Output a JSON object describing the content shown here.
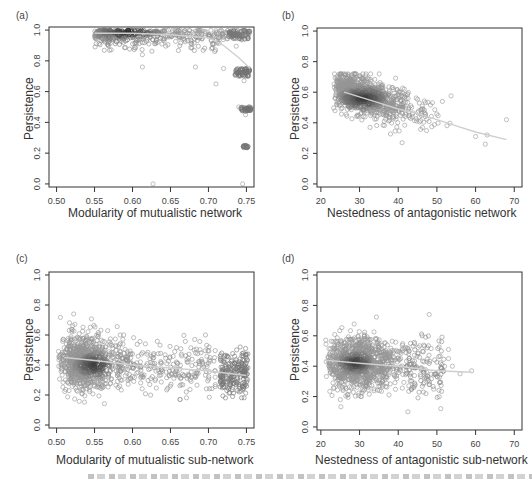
{
  "figure": {
    "panels": [
      {
        "id": "a",
        "label": "(a)",
        "xlabel": "Modularity of mutualistic network",
        "ylabel": "Persistence"
      },
      {
        "id": "b",
        "label": "(b)",
        "xlabel": "Nestedness of antagonistic network",
        "ylabel": "Persistence"
      },
      {
        "id": "c",
        "label": "(c)",
        "xlabel": "Modularity of mutualistic sub-network",
        "ylabel": "Persistence"
      },
      {
        "id": "d",
        "label": "(d)",
        "xlabel": "Nestedness of antagonistic sub-network",
        "ylabel": "Persistence"
      }
    ]
  },
  "chart_data": [
    {
      "panel": "(a)",
      "type": "scatter",
      "title": "",
      "xlabel": "Modularity of mutualistic network",
      "ylabel": "Persistence",
      "xlim": [
        0.49,
        0.76
      ],
      "ylim": [
        -0.02,
        1.02
      ],
      "xticks": [
        "0.50",
        "0.55",
        "0.60",
        "0.65",
        "0.70",
        "0.75"
      ],
      "yticks": [
        "0.0",
        "0.2",
        "0.4",
        "0.6",
        "0.8",
        "1.0"
      ],
      "grid": false,
      "point_color": "#888888",
      "series": [
        {
          "name": "points",
          "description": "dense cluster at persistence ~0.95-1.0 for modularity 0.55-0.75; discrete bands at ~0.75, ~0.5, ~0.25 near modularity 0.74-0.75; outliers at (0.627,0.0), (0.745,0.0), (0.613,0.76), (0.683,0.76), (0.71,0.65), (0.72,0.75)"
        }
      ],
      "trend": {
        "name": "smoothed fit",
        "x": [
          0.55,
          0.6,
          0.65,
          0.7,
          0.72,
          0.74,
          0.755
        ],
        "y": [
          0.98,
          0.98,
          0.97,
          0.95,
          0.9,
          0.82,
          0.75
        ]
      }
    },
    {
      "panel": "(b)",
      "type": "scatter",
      "title": "",
      "xlabel": "Nestedness of antagonistic network",
      "ylabel": "Persistence",
      "xlim": [
        19,
        72
      ],
      "ylim": [
        -0.02,
        1.02
      ],
      "xticks": [
        "20",
        "30",
        "40",
        "50",
        "60",
        "70"
      ],
      "yticks": [
        "0.0",
        "0.2",
        "0.4",
        "0.6",
        "0.8",
        "1.0"
      ],
      "grid": false,
      "point_color": "#888888",
      "series": [
        {
          "name": "points",
          "description": "negative trend; dense core near nestedness 28-35, persistence 0.5-0.6; spread 23-68 in x, 0.24-0.72 in y; outlier at (68,0.42)"
        }
      ],
      "trend": {
        "name": "smoothed fit",
        "x": [
          26,
          30,
          35,
          40,
          45,
          50,
          55,
          60,
          68
        ],
        "y": [
          0.6,
          0.57,
          0.53,
          0.49,
          0.46,
          0.42,
          0.38,
          0.34,
          0.29
        ]
      }
    },
    {
      "panel": "(c)",
      "type": "scatter",
      "title": "",
      "xlabel": "Modularity of mutualistic sub-network",
      "ylabel": "Persistence",
      "xlim": [
        0.49,
        0.76
      ],
      "ylim": [
        -0.02,
        1.02
      ],
      "xticks": [
        "0.50",
        "0.55",
        "0.60",
        "0.65",
        "0.70",
        "0.75"
      ],
      "yticks": [
        "0.0",
        "0.2",
        "0.4",
        "0.6",
        "0.8",
        "1.0"
      ],
      "grid": false,
      "point_color": "#888888",
      "series": [
        {
          "name": "points",
          "description": "dense cluster near modularity 0.52-0.57, persistence 0.3-0.5; secondary cluster near 0.73-0.75; y range 0.1-0.74"
        }
      ],
      "trend": {
        "name": "smoothed fit",
        "x": [
          0.51,
          0.55,
          0.6,
          0.65,
          0.7,
          0.75
        ],
        "y": [
          0.45,
          0.43,
          0.4,
          0.38,
          0.36,
          0.33
        ]
      }
    },
    {
      "panel": "(d)",
      "type": "scatter",
      "title": "",
      "xlabel": "Nestedness of antagonistic sub-network",
      "ylabel": "Persistence",
      "xlim": [
        19,
        72
      ],
      "ylim": [
        -0.02,
        1.02
      ],
      "xticks": [
        "20",
        "30",
        "40",
        "50",
        "60",
        "70"
      ],
      "yticks": [
        "0.0",
        "0.2",
        "0.4",
        "0.6",
        "0.8",
        "1.0"
      ],
      "grid": false,
      "point_color": "#888888",
      "series": [
        {
          "name": "points",
          "description": "dense cluster near nestedness 25-33, persistence 0.35-0.5; spread x 20-59, y 0.1-0.74"
        }
      ],
      "trend": {
        "name": "smoothed fit",
        "x": [
          21,
          30,
          40,
          50,
          59
        ],
        "y": [
          0.44,
          0.42,
          0.4,
          0.37,
          0.36
        ]
      }
    }
  ]
}
